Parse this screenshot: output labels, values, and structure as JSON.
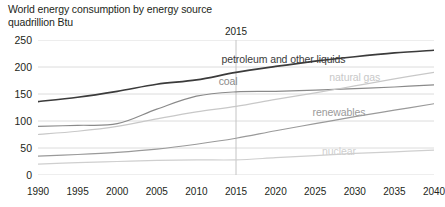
{
  "title": {
    "line1": "World energy consumption by energy source",
    "line2": "quadrillion Btu"
  },
  "annotations": {
    "history_projection_marker": "2015"
  },
  "colors": {
    "petroleum": "#3b3b3b",
    "coal": "#8a8a8a",
    "natural_gas": "#c8c8c8",
    "renewables": "#9a9a9a",
    "nuclear": "#cfcfcf",
    "gridline": "#dcdcdc",
    "text": "#231f20"
  },
  "chart_data": {
    "type": "line",
    "title": "World energy consumption by energy source",
    "subtitle": "quadrillion Btu",
    "xlabel": "",
    "ylabel": "quadrillion Btu",
    "xlim": [
      1990,
      2040
    ],
    "ylim": [
      0,
      250
    ],
    "yticks": [
      0,
      50,
      100,
      150,
      200,
      250
    ],
    "xticks": [
      1990,
      1995,
      2000,
      2005,
      2010,
      2015,
      2020,
      2025,
      2030,
      2035,
      2040
    ],
    "grid": true,
    "legend": "inline-labels",
    "x": [
      1990,
      1995,
      2000,
      2005,
      2010,
      2015,
      2020,
      2025,
      2030,
      2035,
      2040
    ],
    "series": [
      {
        "name": "petroleum and other liquids",
        "label": "petroleum and other liquids",
        "color": "#3b3b3b",
        "values": [
          136,
          144,
          155,
          168,
          176,
          190,
          201,
          211,
          219,
          226,
          231
        ],
        "label_x": 2021,
        "label_y": 215
      },
      {
        "name": "coal",
        "label": "coal",
        "color": "#8a8a8a",
        "values": [
          90,
          92,
          95,
          122,
          146,
          154,
          155,
          157,
          160,
          163,
          167
        ],
        "label_x": 2014,
        "label_y": 175
      },
      {
        "name": "natural gas",
        "label": "natural gas",
        "color": "#c8c8c8",
        "values": [
          75,
          81,
          90,
          104,
          117,
          127,
          140,
          152,
          165,
          178,
          190
        ],
        "label_x": 2030,
        "label_y": 182
      },
      {
        "name": "renewables",
        "label": "renewables",
        "color": "#9a9a9a",
        "values": [
          35,
          38,
          42,
          48,
          57,
          68,
          82,
          95,
          108,
          120,
          132
        ],
        "label_x": 2028,
        "label_y": 117
      },
      {
        "name": "nuclear",
        "label": "nuclear",
        "color": "#cfcfcf",
        "values": [
          20,
          23,
          25,
          27,
          28,
          28,
          32,
          36,
          40,
          43,
          46
        ],
        "label_x": 2028,
        "label_y": 45
      }
    ]
  }
}
